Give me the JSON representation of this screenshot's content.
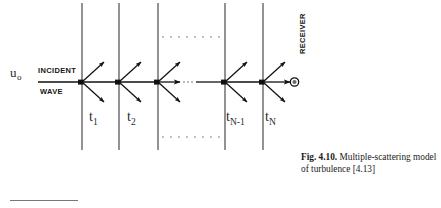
{
  "figure": {
    "incident_label_line1": "INCIDENT",
    "incident_label_line2": "WAVE",
    "amplitude_symbol": "u",
    "amplitude_subscript": "o",
    "receiver_label": "RECEIVER",
    "slab_labels": [
      {
        "base": "t",
        "sub": "1"
      },
      {
        "base": "t",
        "sub": "2"
      },
      {
        "base": "t",
        "sub": "N-1"
      },
      {
        "base": "t",
        "sub": "N"
      }
    ],
    "ellipsis_top": "· · · · · · ·",
    "ellipsis_bottom": "· · · · · · ·",
    "ellipsis_axis": "···",
    "colors": {
      "ink": "#1a1a1a",
      "slab_line": "#3a3a3a",
      "axis": "#111111",
      "dotted": "#9a9a9a",
      "rule": "#777777"
    }
  },
  "caption": {
    "fig_number": "Fig. 4.10.",
    "text": " Multiple-scattering model of turbulence [4.13]"
  }
}
